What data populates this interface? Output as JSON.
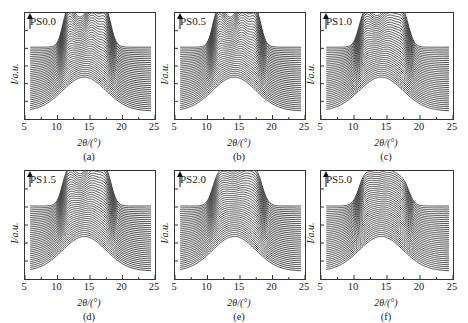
{
  "figure": {
    "panels": [
      {
        "id": "a",
        "label": "PS0.0",
        "sublabel": "(a)",
        "left": 24,
        "top": 12,
        "width": 130,
        "height": 106,
        "peaks": "sharp3",
        "ylabel": "I/a.u.",
        "xlabel": "2θ/(°)"
      },
      {
        "id": "b",
        "label": "PS0.5",
        "sublabel": "(b)",
        "left": 174,
        "top": 12,
        "width": 130,
        "height": 106,
        "peaks": "sharp3",
        "ylabel": "I/a.u.",
        "xlabel": "2θ/(°)"
      },
      {
        "id": "c",
        "label": "PS1.0",
        "sublabel": "(c)",
        "left": 320,
        "top": 12,
        "width": 132,
        "height": 106,
        "peaks": "mid3",
        "ylabel": "I/a.u.",
        "xlabel": "2θ/(°)"
      },
      {
        "id": "d",
        "label": "PS1.5",
        "sublabel": "(d)",
        "left": 24,
        "top": 170,
        "width": 130,
        "height": 108,
        "peaks": "mid3",
        "ylabel": "I/a.u.",
        "xlabel": "2θ/(°)"
      },
      {
        "id": "e",
        "label": "PS2.0",
        "sublabel": "(e)",
        "left": 174,
        "top": 170,
        "width": 130,
        "height": 108,
        "peaks": "broad3",
        "ylabel": "I/a.u.",
        "xlabel": "2θ/(°)"
      },
      {
        "id": "f",
        "label": "PS5.0",
        "sublabel": "(f)",
        "left": 320,
        "top": 170,
        "width": 132,
        "height": 108,
        "peaks": "broad2",
        "ylabel": "I/a.u.",
        "xlabel": "2θ/(°)"
      }
    ],
    "xticks": [
      "5",
      "10",
      "15",
      "20",
      "25"
    ]
  },
  "chart_data": [
    {
      "type": "line",
      "title": "PS0.0",
      "xlabel": "2θ/(°)",
      "ylabel": "I/a.u.",
      "xlim": [
        5,
        25
      ],
      "xticks": [
        5,
        10,
        15,
        20,
        25
      ],
      "series_count": 35,
      "description": "Stacked XRD curves (waterfall, arrow indicates time/increase upward); bottom curves show broad amorphous hump centered ~14°, top curves develop sharp peaks at ~11.5°, ~15.2°, ~17.2°",
      "peaks_2theta": [
        11.5,
        15.2,
        17.2
      ]
    },
    {
      "type": "line",
      "title": "PS0.5",
      "xlabel": "2θ/(°)",
      "ylabel": "I/a.u.",
      "xlim": [
        5,
        25
      ],
      "xticks": [
        5,
        10,
        15,
        20,
        25
      ],
      "series_count": 35,
      "description": "Stacked XRD curves; broad hump ~14° evolving to peaks ~11.5°, ~15.2°, ~17.2°",
      "peaks_2theta": [
        11.5,
        15.2,
        17.2
      ]
    },
    {
      "type": "line",
      "title": "PS1.0",
      "xlabel": "2θ/(°)",
      "ylabel": "I/a.u.",
      "xlim": [
        5,
        25
      ],
      "xticks": [
        5,
        10,
        15,
        20,
        25
      ],
      "series_count": 35,
      "description": "Stacked XRD curves; peaks ~11.5°, ~15.2°, ~17.2° less sharp",
      "peaks_2theta": [
        11.5,
        15.2,
        17.2
      ]
    },
    {
      "type": "line",
      "title": "PS1.5",
      "xlabel": "2θ/(°)",
      "ylabel": "I/a.u.",
      "xlim": [
        5,
        25
      ],
      "xticks": [
        5,
        10,
        15,
        20,
        25
      ],
      "series_count": 35,
      "description": "Stacked XRD curves; peaks ~11.5°, ~15.2°, ~17.2°",
      "peaks_2theta": [
        11.5,
        15.2,
        17.2
      ]
    },
    {
      "type": "line",
      "title": "PS2.0",
      "xlabel": "2θ/(°)",
      "ylabel": "I/a.u.",
      "xlim": [
        5,
        25
      ],
      "xticks": [
        5,
        10,
        15,
        20,
        25
      ],
      "series_count": 35,
      "description": "Stacked XRD curves; broad peaks ~12°, ~15.5°, ~17.5°",
      "peaks_2theta": [
        12,
        15.5,
        17.5
      ]
    },
    {
      "type": "line",
      "title": "PS5.0",
      "xlabel": "2θ/(°)",
      "ylabel": "I/a.u.",
      "xlim": [
        5,
        25
      ],
      "xticks": [
        5,
        10,
        15,
        20,
        25
      ],
      "series_count": 35,
      "description": "Stacked XRD curves; weak broad peaks ~11.5° and ~15°",
      "peaks_2theta": [
        11.5,
        15
      ]
    }
  ]
}
